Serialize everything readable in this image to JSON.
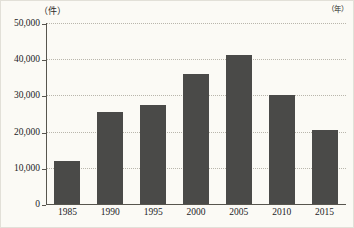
{
  "chart_data": {
    "type": "bar",
    "title": "",
    "subtitle": "",
    "xlabel": "年",
    "ylabel": "件",
    "y_unit_caption": "（件）",
    "x_unit_caption": "（年）",
    "categories": [
      "1985",
      "1990",
      "1995",
      "2000",
      "2005",
      "2010",
      "2015"
    ],
    "values": [
      12000,
      25400,
      27400,
      36000,
      41200,
      30000,
      20500
    ],
    "ylim": [
      0,
      50000
    ],
    "y_ticks": [
      0,
      10000,
      20000,
      30000,
      40000,
      50000
    ],
    "y_tick_labels": [
      "0",
      "10,000",
      "20,000",
      "30,000",
      "40,000",
      "50,000"
    ],
    "grid": true,
    "grid_style": "dotted",
    "legend": false,
    "legend_position": "none",
    "bar_color": "#4a4a48",
    "axis_color": "#57554e",
    "gridline_color": "#b9b6ac",
    "background_color": "#fbfaf5"
  }
}
